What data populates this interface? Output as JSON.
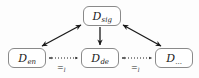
{
  "diagram": {
    "type": "graph",
    "background_color": "#fdfdfd",
    "node_border_color": "#8a8a8a",
    "edge_color": "#1a1a1a",
    "nodes": [
      {
        "id": "sig",
        "base": "D",
        "subscript": "sig",
        "full_label": "D_sig",
        "position": "top-center"
      },
      {
        "id": "en",
        "base": "D",
        "subscript": "en",
        "full_label": "D_en",
        "position": "bottom-left"
      },
      {
        "id": "de",
        "base": "D",
        "subscript": "de",
        "full_label": "D_de",
        "position": "bottom-center"
      },
      {
        "id": "dots",
        "base": "D",
        "subscript": "...",
        "full_label": "D_...",
        "position": "bottom-right"
      }
    ],
    "edges": [
      {
        "id": "sig-en",
        "from": "sig",
        "to": "en",
        "style": "solid",
        "arrowheads": "both",
        "label": ""
      },
      {
        "id": "sig-de",
        "from": "sig",
        "to": "de",
        "style": "solid",
        "arrowheads": "end",
        "label": ""
      },
      {
        "id": "sig-dots",
        "from": "sig",
        "to": "dots",
        "style": "solid",
        "arrowheads": "both",
        "label": ""
      },
      {
        "id": "en-de",
        "from": "en",
        "to": "de",
        "style": "dotted",
        "arrowheads": "both",
        "label_base": "=",
        "label_subscript": "l",
        "label": "=l"
      },
      {
        "id": "de-dots",
        "from": "de",
        "to": "dots",
        "style": "dotted",
        "arrowheads": "both",
        "label_base": "=",
        "label_subscript": "l",
        "label": "=l"
      }
    ]
  }
}
